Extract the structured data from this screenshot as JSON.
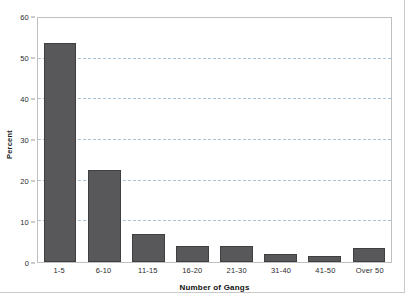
{
  "chart_data": {
    "type": "bar",
    "title": "",
    "xlabel": "Number of Gangs",
    "ylabel": "Percent",
    "categories": [
      "1-5",
      "6-10",
      "11-15",
      "16-20",
      "21-30",
      "31-40",
      "41-50",
      "Over 50"
    ],
    "values": [
      53.8,
      22.7,
      6.8,
      3.9,
      3.9,
      2.0,
      1.4,
      3.4
    ],
    "ylim": [
      0,
      60
    ],
    "ytick_labels": [
      "0",
      "10",
      "20",
      "30",
      "40",
      "50",
      "60"
    ],
    "ytick_values": [
      0,
      10,
      20,
      30,
      40,
      50,
      60
    ],
    "gridlines": [
      10,
      20,
      30,
      40,
      50
    ],
    "grid": true,
    "legend": "none",
    "colors": {
      "bar_fill": "#58585a",
      "bar_edge": "#3f3f41",
      "gridline": "#a9c4d8",
      "plot_border": "#bfbfbf",
      "frame": "#c9c9c9",
      "text": "#2b2b2b",
      "background": "#ffffff"
    }
  }
}
